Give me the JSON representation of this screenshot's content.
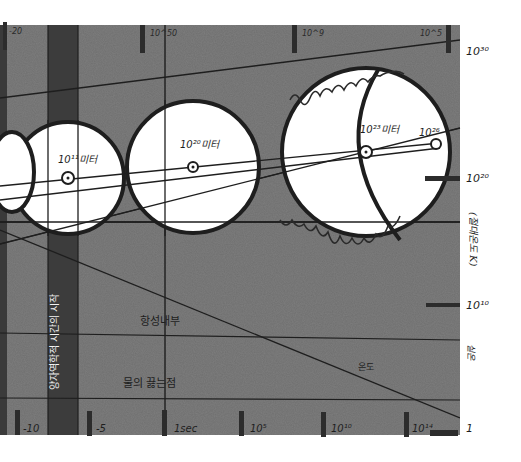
{
  "diagram": {
    "type": "hand-drawn log-scale size diagram",
    "colors": {
      "panel": "#6f6f6f",
      "panel_dark": "#4a4a4a",
      "band": "#3c3c3c",
      "ink": "#1e1e1e",
      "paper": "#ffffff",
      "circle_fill": "#ffffff"
    },
    "top_axis": {
      "ticks": [
        {
          "label": "-20",
          "x": 14
        },
        {
          "label": "10^50",
          "x": 150
        },
        {
          "label": "10^9",
          "x": 300
        },
        {
          "label": "10^5",
          "x": 420
        }
      ]
    },
    "bottom_axis": {
      "ticks": [
        {
          "label": "-10",
          "x": 17
        },
        {
          "label": "-5",
          "x": 89
        },
        {
          "label": "1sec",
          "x": 163
        },
        {
          "label": "10^5",
          "x": 241
        },
        {
          "label": "10^10",
          "x": 323
        },
        {
          "label": "10^14",
          "x": 406
        }
      ]
    },
    "right_axis": {
      "title": "(절대온도 K)",
      "ticks": [
        {
          "label": "10^30",
          "y": 52
        },
        {
          "label": "10^20",
          "y": 178
        },
        {
          "label": "10^10",
          "y": 305
        },
        {
          "label": "1",
          "y": 428
        }
      ],
      "secondary_label": "실온"
    },
    "circles": [
      {
        "label": "10^8미터",
        "cx": 10,
        "cy": 170,
        "r": 30
      },
      {
        "label": "10^11미터",
        "cx": 68,
        "cy": 178,
        "r": 56
      },
      {
        "label": "10^20미터",
        "cx": 193,
        "cy": 167,
        "r": 66
      },
      {
        "label": "10^23미터",
        "cx": 366,
        "cy": 152,
        "r": 84
      },
      {
        "label": "10^26",
        "cx": 436,
        "cy": 144,
        "r": 5
      }
    ],
    "annotations": {
      "vertical_band": "양자역학적 시간의 시작",
      "stellar_interior": "항성내부",
      "boiling_point": "물의 끓는점",
      "room_temp_curve": "온도"
    }
  }
}
